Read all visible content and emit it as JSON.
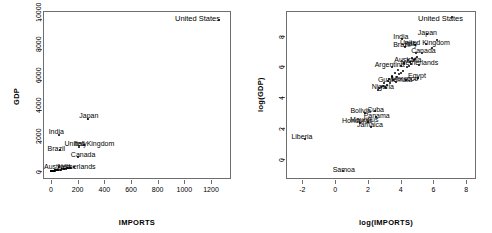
{
  "figure": {
    "title": "",
    "panels": [
      {
        "name": "raw-scale-scatter",
        "xlabel": "IMPORTS",
        "ylabel": "GDP",
        "xticks": [
          "0",
          "200",
          "400",
          "600",
          "800",
          "1000",
          "1200"
        ],
        "yticks": [
          "0",
          "2000",
          "4000",
          "6000",
          "8000",
          "10000"
        ],
        "corner_annotation": "United States"
      },
      {
        "name": "log-scale-scatter",
        "xlabel": "log(IMPORTS)",
        "ylabel": "log(GDP)",
        "xticks": [
          "-2",
          "0",
          "2",
          "4",
          "6",
          "8"
        ],
        "yticks": [
          "0",
          "2",
          "4",
          "6",
          "8"
        ],
        "corner_annotation": "United States"
      }
    ]
  },
  "chart_data": [
    {
      "type": "scatter",
      "name": "GDP vs IMPORTS (raw scale)",
      "title": "",
      "xlabel": "IMPORTS",
      "ylabel": "GDP",
      "xlim": [
        -60,
        1350
      ],
      "ylim": [
        -500,
        10500
      ],
      "xticks": [
        0,
        200,
        400,
        600,
        800,
        1000,
        1200
      ],
      "yticks": [
        0,
        2000,
        4000,
        6000,
        8000,
        10000
      ],
      "grid": false,
      "legend": false,
      "annotations": [
        {
          "label": "United States",
          "x": 1259,
          "y": 9900
        },
        {
          "label": "Japan",
          "x": 280,
          "y": 3600
        },
        {
          "label": "India",
          "x": 50,
          "y": 2600
        },
        {
          "label": "Brazil",
          "x": 55,
          "y": 1480
        },
        {
          "label": "United Kingdom",
          "x": 290,
          "y": 1780
        },
        {
          "label": "Italy",
          "x": 240,
          "y": 1770
        },
        {
          "label": "Canada",
          "x": 230,
          "y": 1080
        },
        {
          "label": "Australia",
          "x": 65,
          "y": 300
        },
        {
          "label": "Netherlands",
          "x": 200,
          "y": 290
        }
      ],
      "points": [
        {
          "x": 1259,
          "y": 9900
        },
        {
          "x": 280,
          "y": 3400
        },
        {
          "x": 60,
          "y": 2400
        },
        {
          "x": 70,
          "y": 1400
        },
        {
          "x": 250,
          "y": 1700
        },
        {
          "x": 210,
          "y": 1600
        },
        {
          "x": 200,
          "y": 950
        },
        {
          "x": 60,
          "y": 290
        },
        {
          "x": 170,
          "y": 280
        },
        {
          "x": 140,
          "y": 230
        },
        {
          "x": 120,
          "y": 190
        },
        {
          "x": 100,
          "y": 160
        },
        {
          "x": 85,
          "y": 140
        },
        {
          "x": 75,
          "y": 120
        },
        {
          "x": 65,
          "y": 110
        },
        {
          "x": 55,
          "y": 95
        },
        {
          "x": 45,
          "y": 85
        },
        {
          "x": 38,
          "y": 75
        },
        {
          "x": 32,
          "y": 65
        },
        {
          "x": 28,
          "y": 55
        },
        {
          "x": 24,
          "y": 48
        },
        {
          "x": 20,
          "y": 42
        },
        {
          "x": 17,
          "y": 36
        },
        {
          "x": 14,
          "y": 30
        },
        {
          "x": 12,
          "y": 25
        },
        {
          "x": 10,
          "y": 21
        },
        {
          "x": 8,
          "y": 17
        },
        {
          "x": 7,
          "y": 14
        },
        {
          "x": 6,
          "y": 11
        },
        {
          "x": 5,
          "y": 9
        },
        {
          "x": 4,
          "y": 7
        },
        {
          "x": 3,
          "y": 5
        },
        {
          "x": 2.5,
          "y": 4
        },
        {
          "x": 2,
          "y": 3
        },
        {
          "x": 1.5,
          "y": 2.2
        },
        {
          "x": 1.2,
          "y": 1.6
        },
        {
          "x": 0.9,
          "y": 1.1
        },
        {
          "x": 0.7,
          "y": 0.8
        },
        {
          "x": 0.5,
          "y": 0.5
        },
        {
          "x": 0.35,
          "y": 0.3
        },
        {
          "x": 0.25,
          "y": 0.2
        },
        {
          "x": 0.15,
          "y": 0.12
        },
        {
          "x": 0.08,
          "y": 0.06
        },
        {
          "x": 95,
          "y": 150
        },
        {
          "x": 110,
          "y": 180
        },
        {
          "x": 130,
          "y": 210
        },
        {
          "x": 150,
          "y": 250
        },
        {
          "x": 50,
          "y": 90
        },
        {
          "x": 42,
          "y": 80
        },
        {
          "x": 36,
          "y": 70
        },
        {
          "x": 30,
          "y": 60
        },
        {
          "x": 26,
          "y": 52
        },
        {
          "x": 22,
          "y": 45
        },
        {
          "x": 18,
          "y": 38
        },
        {
          "x": 16,
          "y": 33
        },
        {
          "x": 13,
          "y": 28
        },
        {
          "x": 11,
          "y": 23
        },
        {
          "x": 9,
          "y": 19
        },
        {
          "x": 7.5,
          "y": 15
        },
        {
          "x": 6.5,
          "y": 12
        },
        {
          "x": 5.5,
          "y": 10
        },
        {
          "x": 4.5,
          "y": 8
        },
        {
          "x": 3.5,
          "y": 6
        },
        {
          "x": 2.8,
          "y": 4.5
        },
        {
          "x": 2.2,
          "y": 3.5
        },
        {
          "x": 1.8,
          "y": 2.6
        },
        {
          "x": 1.4,
          "y": 1.9
        },
        {
          "x": 1.0,
          "y": 1.3
        },
        {
          "x": 0.6,
          "y": 0.6
        },
        {
          "x": 0.3,
          "y": 0.25
        }
      ]
    },
    {
      "type": "scatter",
      "name": "log(GDP) vs log(IMPORTS)",
      "title": "",
      "xlabel": "log(IMPORTS)",
      "ylabel": "log(GDP)",
      "xlim": [
        -3.0,
        8.6
      ],
      "ylim": [
        -1.3,
        9.6
      ],
      "xticks": [
        -2,
        0,
        2,
        4,
        6,
        8
      ],
      "yticks": [
        0,
        2,
        4,
        6,
        8
      ],
      "grid": false,
      "legend": false,
      "annotations": [
        {
          "label": "United States",
          "x": 7.1,
          "y": 9.2
        },
        {
          "label": "Japan",
          "x": 5.6,
          "y": 8.2
        },
        {
          "label": "India",
          "x": 4.1,
          "y": 7.9
        },
        {
          "label": "United Kingdom",
          "x": 5.5,
          "y": 7.5
        },
        {
          "label": "Italy",
          "x": 4.8,
          "y": 7.45
        },
        {
          "label": "Brazil",
          "x": 4.2,
          "y": 7.4
        },
        {
          "label": "Canada",
          "x": 5.3,
          "y": 7.0
        },
        {
          "label": "Australia",
          "x": 4.6,
          "y": 6.4
        },
        {
          "label": "Netherlands",
          "x": 5.2,
          "y": 6.2
        },
        {
          "label": "Argentina",
          "x": 3.4,
          "y": 6.1
        },
        {
          "label": "Egypt",
          "x": 5.0,
          "y": 5.4
        },
        {
          "label": "Morocco",
          "x": 4.2,
          "y": 5.2
        },
        {
          "label": "Guatemala",
          "x": 3.6,
          "y": 5.1
        },
        {
          "label": "Nigeria",
          "x": 3.0,
          "y": 4.7
        },
        {
          "label": "Cuba",
          "x": 2.4,
          "y": 3.2
        },
        {
          "label": "Bolivia",
          "x": 1.7,
          "y": 3.1
        },
        {
          "label": "Panama",
          "x": 2.4,
          "y": 2.8
        },
        {
          "label": "Mauritius",
          "x": 1.9,
          "y": 2.5
        },
        {
          "label": "Honduras",
          "x": 1.3,
          "y": 2.45
        },
        {
          "label": "Jamaica",
          "x": 2.1,
          "y": 2.2
        },
        {
          "label": "Liberia",
          "x": -1.9,
          "y": 1.4
        },
        {
          "label": "Samoa",
          "x": 0.4,
          "y": -0.7
        }
      ],
      "points": [
        {
          "x": 7.14,
          "y": 9.2
        },
        {
          "x": 5.63,
          "y": 8.13
        },
        {
          "x": 4.09,
          "y": 7.78
        },
        {
          "x": 5.52,
          "y": 7.44
        },
        {
          "x": 4.86,
          "y": 7.38
        },
        {
          "x": 4.25,
          "y": 7.24
        },
        {
          "x": 5.3,
          "y": 6.86
        },
        {
          "x": 4.6,
          "y": 6.3
        },
        {
          "x": 5.15,
          "y": 6.1
        },
        {
          "x": 3.5,
          "y": 5.98
        },
        {
          "x": 5.05,
          "y": 5.25
        },
        {
          "x": 4.3,
          "y": 5.1
        },
        {
          "x": 3.7,
          "y": 5.0
        },
        {
          "x": 3.1,
          "y": 4.6
        },
        {
          "x": 2.45,
          "y": 3.1
        },
        {
          "x": 1.85,
          "y": 3.0
        },
        {
          "x": 2.5,
          "y": 2.7
        },
        {
          "x": 2.0,
          "y": 2.4
        },
        {
          "x": 1.5,
          "y": 2.35
        },
        {
          "x": 2.2,
          "y": 2.1
        },
        {
          "x": -1.85,
          "y": 1.3
        },
        {
          "x": 0.5,
          "y": -0.8
        },
        {
          "x": 6.2,
          "y": 7.7
        },
        {
          "x": 5.9,
          "y": 7.2
        },
        {
          "x": 4.95,
          "y": 6.85
        },
        {
          "x": 4.7,
          "y": 6.55
        },
        {
          "x": 4.45,
          "y": 6.4
        },
        {
          "x": 4.2,
          "y": 6.2
        },
        {
          "x": 4.0,
          "y": 6.0
        },
        {
          "x": 3.85,
          "y": 5.8
        },
        {
          "x": 3.65,
          "y": 5.6
        },
        {
          "x": 3.45,
          "y": 5.4
        },
        {
          "x": 3.3,
          "y": 5.2
        },
        {
          "x": 3.2,
          "y": 5.05
        },
        {
          "x": 3.0,
          "y": 4.9
        },
        {
          "x": 2.9,
          "y": 4.75
        },
        {
          "x": 3.5,
          "y": 5.3
        },
        {
          "x": 3.9,
          "y": 5.5
        },
        {
          "x": 4.15,
          "y": 5.7
        },
        {
          "x": 4.4,
          "y": 5.95
        },
        {
          "x": 4.8,
          "y": 6.45
        },
        {
          "x": 5.0,
          "y": 6.6
        },
        {
          "x": 3.35,
          "y": 4.95
        },
        {
          "x": 3.15,
          "y": 4.8
        },
        {
          "x": 3.55,
          "y": 5.15
        },
        {
          "x": 3.75,
          "y": 5.35
        },
        {
          "x": 4.05,
          "y": 5.55
        },
        {
          "x": 4.5,
          "y": 6.05
        },
        {
          "x": 4.65,
          "y": 6.15
        },
        {
          "x": 4.9,
          "y": 6.5
        },
        {
          "x": 2.7,
          "y": 4.6
        },
        {
          "x": 2.6,
          "y": 4.5
        },
        {
          "x": 3.05,
          "y": 4.7
        },
        {
          "x": 2.8,
          "y": 4.65
        }
      ]
    }
  ]
}
